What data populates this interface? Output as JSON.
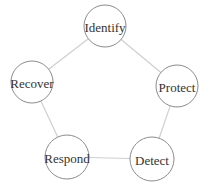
{
  "diagram": {
    "type": "cycle",
    "colors": {
      "edge": "#cfcfcf",
      "node_stroke": "#8c8c8c",
      "node_fill": "#ffffff",
      "label": "#333333",
      "background": "#ffffff"
    },
    "nodes": [
      {
        "id": "identify",
        "label": "Identify",
        "cx": 105,
        "cy": 26,
        "r": 21
      },
      {
        "id": "protect",
        "label": "Protect",
        "cx": 177,
        "cy": 86,
        "r": 21
      },
      {
        "id": "detect",
        "label": "Detect",
        "cx": 152,
        "cy": 159,
        "r": 22
      },
      {
        "id": "respond",
        "label": "Respond",
        "cx": 67,
        "cy": 157,
        "r": 22
      },
      {
        "id": "recover",
        "label": "Recover",
        "cx": 32,
        "cy": 82,
        "r": 21
      }
    ],
    "edges": [
      {
        "from": "identify",
        "to": "protect"
      },
      {
        "from": "protect",
        "to": "detect"
      },
      {
        "from": "detect",
        "to": "respond"
      },
      {
        "from": "respond",
        "to": "recover"
      },
      {
        "from": "recover",
        "to": "identify"
      }
    ]
  }
}
